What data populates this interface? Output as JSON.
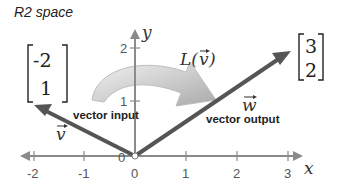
{
  "title": "R2 space",
  "axes": {
    "x_label": "x",
    "y_label": "y",
    "x_ticks": [
      "-2",
      "-1",
      "0",
      "1",
      "2",
      "3"
    ],
    "y_ticks": [
      "1",
      "2"
    ],
    "origin_label": "0"
  },
  "input_vector": {
    "name": "v",
    "label": "vector input",
    "matrix": [
      "-2",
      "1"
    ],
    "components": [
      -2,
      1
    ]
  },
  "output_vector": {
    "name": "w",
    "label": "vector output",
    "matrix": [
      "3",
      "2"
    ],
    "components": [
      3,
      2
    ]
  },
  "transform": {
    "label": "L(v)",
    "name": "L"
  },
  "colors": {
    "axis": "#8a8a8a",
    "vector": "#555555",
    "curved_arrow": "#c8c8c8"
  }
}
